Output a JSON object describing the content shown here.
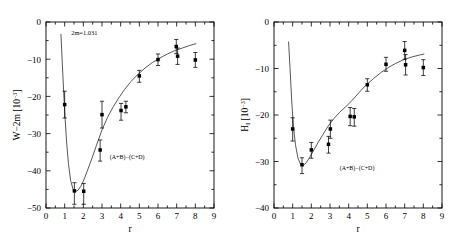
{
  "figure": {
    "background": "#ffffff",
    "marker_color": "#000000",
    "curve_color": "#3a3a3a"
  },
  "chart_data": [
    {
      "type": "scatter",
      "panel": "left",
      "title": "",
      "xlabel": "r",
      "ylabel": "W−2m  [10⁻³]",
      "ylabel_main": "W−2m",
      "ylabel_unit": "[10",
      "ylabel_exp": "−3",
      "ylabel_unit_close": "]",
      "xlim": [
        0,
        9
      ],
      "ylim": [
        -50,
        0
      ],
      "xticks": [
        0,
        1,
        2,
        3,
        4,
        5,
        6,
        7,
        8,
        9
      ],
      "xticklabels": [
        "0",
        "1",
        "2",
        "3",
        "4",
        "5",
        "6",
        "7",
        "8",
        "9"
      ],
      "yticks": [
        0,
        -10,
        -20,
        -30,
        -40,
        -50
      ],
      "yticklabels": [
        "0",
        "−10",
        "−20",
        "−30",
        "−40",
        "−50"
      ],
      "grid": false,
      "legend": false,
      "annotations": [
        {
          "text": "2m=1.031",
          "x": 2.05,
          "y": -3.4,
          "name": "mass-annotation"
        },
        {
          "text": "(A+B)−(C+D)",
          "x": 4.35,
          "y": -36.8,
          "name": "channel-annotation"
        }
      ],
      "points": [
        {
          "x": 1.0,
          "y": -22.2,
          "yerr_up": 3.6,
          "yerr_dn": 3.6
        },
        {
          "x": 1.52,
          "y": -45.4,
          "yerr_up": 2.2,
          "yerr_dn": 3.6
        },
        {
          "x": 2.02,
          "y": -45.5,
          "yerr_up": 2.1,
          "yerr_dn": 3.5
        },
        {
          "x": 2.9,
          "y": -34.4,
          "yerr_up": 2.7,
          "yerr_dn": 3.0
        },
        {
          "x": 3.0,
          "y": -24.9,
          "yerr_up": 3.6,
          "yerr_dn": 3.6
        },
        {
          "x": 4.02,
          "y": -23.8,
          "yerr_up": 1.9,
          "yerr_dn": 2.6
        },
        {
          "x": 4.28,
          "y": -22.8,
          "yerr_up": 1.5,
          "yerr_dn": 1.6
        },
        {
          "x": 5.0,
          "y": -14.5,
          "yerr_up": 1.5,
          "yerr_dn": 1.7
        },
        {
          "x": 6.0,
          "y": -10.1,
          "yerr_up": 1.5,
          "yerr_dn": 1.6
        },
        {
          "x": 6.98,
          "y": -6.6,
          "yerr_up": 1.9,
          "yerr_dn": 1.9
        },
        {
          "x": 7.05,
          "y": -9.2,
          "yerr_up": 2.2,
          "yerr_dn": 2.2
        },
        {
          "x": 8.0,
          "y": -10.2,
          "yerr_up": 2.0,
          "yerr_dn": 2.0
        }
      ],
      "curve": [
        [
          0.8,
          -3.2
        ],
        [
          0.9,
          -14.0
        ],
        [
          1.0,
          -24.0
        ],
        [
          1.1,
          -32.0
        ],
        [
          1.2,
          -38.0
        ],
        [
          1.32,
          -42.6
        ],
        [
          1.45,
          -45.0
        ],
        [
          1.58,
          -45.6
        ],
        [
          1.72,
          -45.2
        ],
        [
          1.86,
          -44.2
        ],
        [
          2.0,
          -42.8
        ],
        [
          2.2,
          -40.2
        ],
        [
          2.45,
          -36.8
        ],
        [
          2.7,
          -33.2
        ],
        [
          3.0,
          -29.0
        ],
        [
          3.3,
          -25.6
        ],
        [
          3.6,
          -22.8
        ],
        [
          3.9,
          -20.4
        ],
        [
          4.2,
          -18.2
        ],
        [
          4.55,
          -16.0
        ],
        [
          4.9,
          -14.2
        ],
        [
          5.3,
          -12.4
        ],
        [
          5.7,
          -10.9
        ],
        [
          6.1,
          -9.7
        ],
        [
          6.5,
          -8.6
        ],
        [
          6.9,
          -7.7
        ],
        [
          7.3,
          -7.0
        ],
        [
          7.7,
          -6.3
        ],
        [
          8.05,
          -5.8
        ]
      ]
    },
    {
      "type": "scatter",
      "panel": "right",
      "title": "",
      "xlabel": "r",
      "ylabel": "H₁  [10⁻³]",
      "ylabel_main": "H",
      "ylabel_sub": "I",
      "ylabel_unit": "[10",
      "ylabel_exp": "−3",
      "ylabel_unit_close": "]",
      "xlim": [
        0,
        9
      ],
      "ylim": [
        -40,
        0
      ],
      "xticks": [
        0,
        1,
        2,
        3,
        4,
        5,
        6,
        7,
        8,
        9
      ],
      "xticklabels": [
        "0",
        "1",
        "2",
        "3",
        "4",
        "5",
        "6",
        "7",
        "8",
        "9"
      ],
      "yticks": [
        0,
        -10,
        -20,
        -30,
        -40
      ],
      "yticklabels": [
        "0",
        "−10",
        "−20",
        "−30",
        "−40"
      ],
      "grid": false,
      "legend": false,
      "annotations": [
        {
          "text": "(A+B)−(C+D)",
          "x": 4.45,
          "y": -31.8,
          "name": "channel-annotation"
        }
      ],
      "points": [
        {
          "x": 1.0,
          "y": -23.0,
          "yerr_up": 2.4,
          "yerr_dn": 2.6
        },
        {
          "x": 1.5,
          "y": -30.7,
          "yerr_up": 1.5,
          "yerr_dn": 1.9
        },
        {
          "x": 2.0,
          "y": -27.5,
          "yerr_up": 1.6,
          "yerr_dn": 1.8
        },
        {
          "x": 2.92,
          "y": -26.3,
          "yerr_up": 1.7,
          "yerr_dn": 1.9
        },
        {
          "x": 3.02,
          "y": -23.0,
          "yerr_up": 1.9,
          "yerr_dn": 2.0
        },
        {
          "x": 4.08,
          "y": -20.3,
          "yerr_up": 1.9,
          "yerr_dn": 2.0
        },
        {
          "x": 4.3,
          "y": -20.4,
          "yerr_up": 1.8,
          "yerr_dn": 2.0
        },
        {
          "x": 5.0,
          "y": -13.5,
          "yerr_up": 1.3,
          "yerr_dn": 1.4
        },
        {
          "x": 6.0,
          "y": -9.1,
          "yerr_up": 1.5,
          "yerr_dn": 1.5
        },
        {
          "x": 7.0,
          "y": -6.1,
          "yerr_up": 1.9,
          "yerr_dn": 1.9
        },
        {
          "x": 7.05,
          "y": -9.2,
          "yerr_up": 2.2,
          "yerr_dn": 2.2
        },
        {
          "x": 8.0,
          "y": -9.8,
          "yerr_up": 1.7,
          "yerr_dn": 1.7
        }
      ],
      "curve": [
        [
          0.78,
          -4.2
        ],
        [
          0.86,
          -10.0
        ],
        [
          0.95,
          -17.0
        ],
        [
          1.04,
          -22.4
        ],
        [
          1.15,
          -26.4
        ],
        [
          1.28,
          -29.2
        ],
        [
          1.42,
          -30.6
        ],
        [
          1.56,
          -30.9
        ],
        [
          1.72,
          -30.3
        ],
        [
          1.9,
          -29.2
        ],
        [
          2.1,
          -27.8
        ],
        [
          2.35,
          -26.0
        ],
        [
          2.62,
          -24.2
        ],
        [
          2.9,
          -22.4
        ],
        [
          3.2,
          -20.8
        ],
        [
          3.52,
          -19.4
        ],
        [
          3.85,
          -18.2
        ],
        [
          4.2,
          -16.8
        ],
        [
          4.55,
          -15.2
        ],
        [
          4.92,
          -13.6
        ],
        [
          5.32,
          -12.2
        ],
        [
          5.72,
          -10.9
        ],
        [
          6.12,
          -9.8
        ],
        [
          6.52,
          -8.9
        ],
        [
          6.95,
          -8.1
        ],
        [
          7.4,
          -7.5
        ],
        [
          7.8,
          -7.1
        ],
        [
          8.05,
          -6.9
        ]
      ]
    }
  ]
}
